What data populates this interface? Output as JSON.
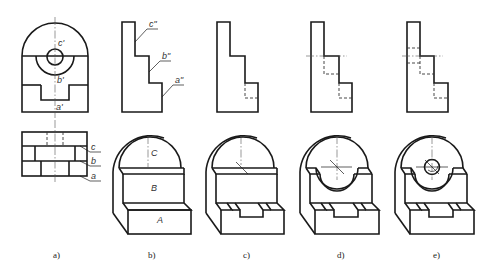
{
  "figure": {
    "panels": [
      {
        "id": "a",
        "caption": "a)",
        "front_labels": [
          "c'",
          "b'",
          "a'"
        ],
        "top_labels": [
          "c",
          "b",
          "a"
        ]
      },
      {
        "id": "b",
        "caption": "b)",
        "side_labels": [
          "c\"",
          "b\"",
          "a\""
        ],
        "iso_labels": [
          "C",
          "B",
          "A"
        ]
      },
      {
        "id": "c",
        "caption": "c)"
      },
      {
        "id": "d",
        "caption": "d)"
      },
      {
        "id": "e",
        "caption": "e)"
      }
    ]
  }
}
